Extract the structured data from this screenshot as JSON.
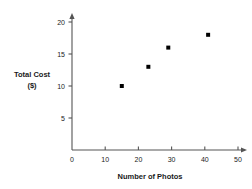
{
  "chart_data": {
    "type": "scatter",
    "title": "",
    "xlabel": "Number of Photos",
    "ylabel_line1": "Total Cost",
    "ylabel_line2": "($)",
    "xlim": [
      0,
      55
    ],
    "ylim": [
      0,
      22
    ],
    "xticks": [
      0,
      10,
      20,
      30,
      40,
      50
    ],
    "yticks": [
      5,
      10,
      15,
      20
    ],
    "xtick_labels": [
      "0",
      "10",
      "20",
      "30",
      "40",
      "50"
    ],
    "ytick_labels": [
      "5",
      "10",
      "15",
      "20"
    ],
    "grid": false,
    "legend": false,
    "marker_color": "#000000",
    "axis_color": "#555555",
    "points": [
      {
        "x": 15,
        "y": 10
      },
      {
        "x": 23,
        "y": 13
      },
      {
        "x": 29,
        "y": 16
      },
      {
        "x": 41,
        "y": 18
      }
    ]
  }
}
